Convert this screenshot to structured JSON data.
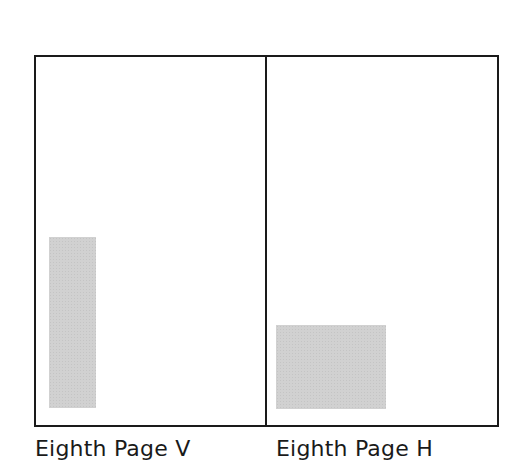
{
  "diagram": {
    "panels": [
      {
        "label": "Eighth Page V",
        "orientation": "vertical",
        "ad_block": {
          "x": 49,
          "y": 237,
          "width": 47,
          "height": 171,
          "color": "#d1d1d1"
        }
      },
      {
        "label": "Eighth Page H",
        "orientation": "horizontal",
        "ad_block": {
          "x": 276,
          "y": 325,
          "width": 110,
          "height": 84,
          "color": "#d1d1d1"
        }
      }
    ],
    "border_color": "#1a1a1a"
  }
}
